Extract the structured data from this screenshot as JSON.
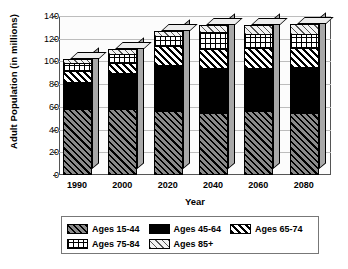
{
  "chart_data": {
    "type": "bar",
    "subtype": "stacked-bar-3d",
    "title": "",
    "xlabel": "Year",
    "ylabel": "Adult Population (in millions)",
    "categories": [
      "1990",
      "2000",
      "2020",
      "2040",
      "2060",
      "2080"
    ],
    "ylim": [
      0,
      140
    ],
    "yticks": [
      "0",
      "20",
      "40",
      "60",
      "80",
      "100",
      "120",
      "140"
    ],
    "ytick_values": [
      0,
      20,
      40,
      60,
      80,
      100,
      120,
      140
    ],
    "grid": true,
    "legend_position": "bottom",
    "series": [
      {
        "name": "Ages 15-44",
        "pattern": "dark-diagonal-hatch",
        "values": [
          58,
          58,
          56,
          55,
          56,
          55
        ]
      },
      {
        "name": "Ages 45-64",
        "pattern": "solid-black",
        "values": [
          24,
          32,
          41,
          39,
          38,
          40
        ]
      },
      {
        "name": "Ages 65-74",
        "pattern": "diagonal-stripe",
        "values": [
          10,
          9,
          17,
          17,
          18,
          17
        ]
      },
      {
        "name": "Ages 75-84",
        "pattern": "grid-crosshatch",
        "values": [
          7,
          8,
          8,
          15,
          12,
          12
        ]
      },
      {
        "name": "Ages 85+",
        "pattern": "light-diagonal-hatch",
        "values": [
          3,
          4,
          5,
          6,
          8,
          9
        ]
      }
    ],
    "totals": [
      102,
      111,
      127,
      132,
      132,
      133
    ]
  },
  "legend": {
    "rows": [
      [
        {
          "label": "Ages 15-44",
          "swatch": "p-1544"
        },
        {
          "label": "Ages 45-64",
          "swatch": "p-4564"
        },
        {
          "label": "Ages 65-74",
          "swatch": "p-6574"
        }
      ],
      [
        {
          "label": "Ages 75-84",
          "swatch": "p-7584"
        },
        {
          "label": "Ages 85+",
          "swatch": "p-85"
        }
      ]
    ]
  }
}
